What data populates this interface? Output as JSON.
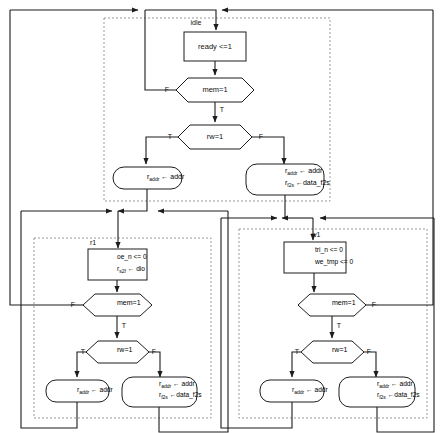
{
  "diagram": {
    "colors": {
      "stroke": "#1c1c1c",
      "group_stroke": "#9a9a9a",
      "background": "#ffffff"
    },
    "edge_labels": {
      "true": "T",
      "false": "F"
    },
    "groups": [
      {
        "id": "idle",
        "label": "idle"
      },
      {
        "id": "r1",
        "label": "r1"
      },
      {
        "id": "w1",
        "label": "w1"
      }
    ],
    "nodes": {
      "idle_action": {
        "type": "process",
        "text": "ready <=1"
      },
      "idle_mem": {
        "type": "decision",
        "text": "mem=1"
      },
      "idle_rw": {
        "type": "decision",
        "text": "rw=1"
      },
      "idle_read": {
        "type": "terminator",
        "line1_var": "r",
        "line1_sub": "addr",
        "line1_rest": "← addr"
      },
      "idle_write": {
        "type": "terminator",
        "line1_var": "r",
        "line1_sub": "addr",
        "line1_rest": "← addr",
        "line2_var": "r",
        "line2_sub": "f2s",
        "line2_rest": "←data_f2s"
      },
      "r1_action": {
        "type": "process",
        "line1": "oe_n <= 0",
        "line2_var": "r",
        "line2_sub": "s2f",
        "line2_rest": "← dio"
      },
      "r1_mem": {
        "type": "decision",
        "text": "mem=1"
      },
      "r1_rw": {
        "type": "decision",
        "text": "rw=1"
      },
      "r1_read": {
        "type": "terminator",
        "line1_var": "r",
        "line1_sub": "addr",
        "line1_rest": "← addr"
      },
      "r1_write": {
        "type": "terminator",
        "line1_var": "r",
        "line1_sub": "addr",
        "line1_rest": "← addr",
        "line2_var": "r",
        "line2_sub": "f2s",
        "line2_rest": "←data_f2s"
      },
      "w1_action": {
        "type": "process",
        "line1": "tri_n <= 0",
        "line2": "we_tmp <= 0"
      },
      "w1_mem": {
        "type": "decision",
        "text": "mem=1"
      },
      "w1_rw": {
        "type": "decision",
        "text": "rw=1"
      },
      "w1_read": {
        "type": "terminator",
        "line1_var": "r",
        "line1_sub": "addr",
        "line1_rest": "← addr"
      },
      "w1_write": {
        "type": "terminator",
        "line1_var": "r",
        "line1_sub": "addr",
        "line1_rest": "← addr",
        "line2_var": "r",
        "line2_sub": "f2s",
        "line2_rest": "←data_f2s"
      }
    }
  }
}
